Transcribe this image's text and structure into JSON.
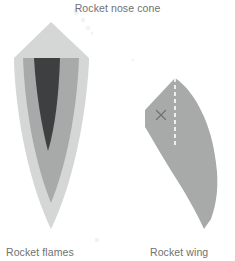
{
  "canvas": {
    "width": 235,
    "height": 261,
    "background": "#ffffff"
  },
  "labels": {
    "nose_cone": "Rocket nose cone",
    "flames": "Rocket flames",
    "wing": "Rocket wing"
  },
  "colors": {
    "text": "#6e7173",
    "flame_outer": "#d5d7d6",
    "flame_middle": "#a8aaa9",
    "flame_core": "#3d4040",
    "wing_fill": "#a8aaa9",
    "wing_dash": "#ffffff",
    "wing_mark": "#6e7173",
    "speck": "#f2f3f3"
  },
  "shapes": {
    "flame_outer": {
      "name": "flame-outer-layer",
      "fill": "#d5d7d6",
      "path": "M 51 22 L 89 58 L 89 62 C 86 120 72 186 51 229 C 30 186 16 120 14 62 L 14 58 Z"
    },
    "flame_middle": {
      "name": "flame-middle-layer",
      "fill": "#a8aaa9",
      "path": "M 23 58 L 79 58 C 77 112 66 166 51 203 C 36 166 25 112 23 58 Z"
    },
    "flame_core": {
      "name": "flame-core-layer",
      "fill": "#3d4040",
      "path": "M 34 58 L 60 58 C 59 94 55 128 48 151 C 42 128 36 94 34 58 Z"
    },
    "wing": {
      "name": "wing-body",
      "fill": "#a8aaa9",
      "path": "M 175 78 C 196 92 212 126 216 163 C 219 184 217 203 211 219 L 204 229 C 198 216 189 199 177 180 C 163 158 153 140 145 127 L 145 110 Z"
    },
    "wing_dash": {
      "name": "wing-chord-dashed-line",
      "stroke": "#ffffff",
      "x1": 175,
      "y1": 78,
      "x2": 175,
      "y2": 148,
      "dash": "4 3",
      "width": 1.6
    },
    "wing_mark": {
      "name": "wing-x-mark",
      "stroke": "#6e7173",
      "cx": 161,
      "cy": 115,
      "size": 4.5,
      "width": 1.2
    },
    "specks": [
      {
        "name": "speck-a",
        "cx": 76,
        "cy": 12,
        "rx": 2.4,
        "ry": 3.6,
        "rot": -20
      },
      {
        "name": "speck-b",
        "cx": 83,
        "cy": 20,
        "rx": 2.0,
        "ry": 2.6,
        "rot": 15
      },
      {
        "name": "speck-c",
        "cx": 88,
        "cy": 28,
        "rx": 2.6,
        "ry": 2.0,
        "rot": 0
      },
      {
        "name": "speck-d",
        "cx": 92,
        "cy": 33,
        "rx": 1.6,
        "ry": 1.6,
        "rot": 0
      },
      {
        "name": "speck-e",
        "cx": 97,
        "cy": 240,
        "rx": 2.2,
        "ry": 2.2,
        "rot": 0
      },
      {
        "name": "speck-f",
        "cx": 133,
        "cy": 60,
        "rx": 1.6,
        "ry": 1.6,
        "rot": 0
      }
    ]
  }
}
